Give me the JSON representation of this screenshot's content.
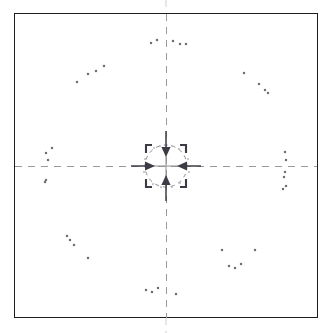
{
  "figure": {
    "title": "",
    "background_color": "#ffffff",
    "frame_color": "#1d1d1d",
    "axis_color": "#9a9a9a",
    "point_color": "#6f6f7a",
    "arrow_color": "#3c3c46",
    "width": 332,
    "height": 333
  },
  "chart_data": {
    "type": "scatter",
    "title": "",
    "subtitle": "",
    "xlabel": "",
    "ylabel": "",
    "xlim": [
      -166,
      166
    ],
    "ylim": [
      -166,
      166
    ],
    "grid": false,
    "legend": null,
    "center": {
      "x": 166,
      "y": 166
    },
    "annotations": {
      "center_circle_radius": 21,
      "crosshair_tick_length": 9,
      "axes": [
        {
          "name": "vertical-axis",
          "x1": 166,
          "y1": 2,
          "x2": 166,
          "y2": 331
        },
        {
          "name": "horizontal-axis",
          "x1": 2,
          "y1": 166,
          "x2": 330,
          "y2": 166
        }
      ],
      "inward_arrows": [
        {
          "name": "arrow-from-top",
          "dir": "down",
          "x": 166,
          "y1": 139,
          "y2": 158
        },
        {
          "name": "arrow-from-bottom",
          "dir": "up",
          "x": 166,
          "y1": 195,
          "y2": 176
        },
        {
          "name": "arrow-from-left",
          "dir": "right",
          "y": 166,
          "x1": 137,
          "x2": 155
        },
        {
          "name": "arrow-from-right",
          "dir": "left",
          "y": 166,
          "x1": 197,
          "x2": 178
        }
      ],
      "hook_glyphs": [
        {
          "name": "hook-top-left",
          "x": 148,
          "y": 150,
          "rotation": 0
        },
        {
          "name": "hook-top-right",
          "x": 184,
          "y": 150,
          "rotation": 90
        },
        {
          "name": "hook-bottom-left",
          "x": 148,
          "y": 182,
          "rotation": 270
        },
        {
          "name": "hook-bottom-right",
          "x": 184,
          "y": 182,
          "rotation": 180
        }
      ]
    },
    "series": [
      {
        "name": "quadrant-upper-left",
        "color": "#6f6f7a",
        "points": [
          {
            "x": 88,
            "y": 74
          },
          {
            "x": 96,
            "y": 71
          },
          {
            "x": 104,
            "y": 66
          },
          {
            "x": 77,
            "y": 82
          },
          {
            "x": 46,
            "y": 153
          },
          {
            "x": 48,
            "y": 160
          },
          {
            "x": 52,
            "y": 148
          },
          {
            "x": 45,
            "y": 182
          },
          {
            "x": 151,
            "y": 43
          },
          {
            "x": 157,
            "y": 40
          }
        ]
      },
      {
        "name": "quadrant-upper-right",
        "color": "#6f6f7a",
        "points": [
          {
            "x": 173,
            "y": 41
          },
          {
            "x": 180,
            "y": 44
          },
          {
            "x": 186,
            "y": 44
          },
          {
            "x": 244,
            "y": 73
          },
          {
            "x": 259,
            "y": 84
          },
          {
            "x": 265,
            "y": 90
          },
          {
            "x": 268,
            "y": 93
          },
          {
            "x": 285,
            "y": 152
          },
          {
            "x": 286,
            "y": 160
          },
          {
            "x": 285,
            "y": 172
          }
        ]
      },
      {
        "name": "quadrant-lower-left",
        "color": "#6f6f7a",
        "points": [
          {
            "x": 46,
            "y": 180
          },
          {
            "x": 67,
            "y": 236
          },
          {
            "x": 70,
            "y": 240
          },
          {
            "x": 74,
            "y": 245
          },
          {
            "x": 88,
            "y": 258
          },
          {
            "x": 146,
            "y": 290
          },
          {
            "x": 152,
            "y": 292
          },
          {
            "x": 158,
            "y": 288
          }
        ]
      },
      {
        "name": "quadrant-lower-right",
        "color": "#6f6f7a",
        "points": [
          {
            "x": 176,
            "y": 294
          },
          {
            "x": 222,
            "y": 250
          },
          {
            "x": 229,
            "y": 266
          },
          {
            "x": 235,
            "y": 268
          },
          {
            "x": 241,
            "y": 264
          },
          {
            "x": 255,
            "y": 250
          },
          {
            "x": 284,
            "y": 177
          },
          {
            "x": 286,
            "y": 186
          },
          {
            "x": 283,
            "y": 189
          }
        ]
      },
      {
        "name": "inner-ring-points",
        "color": "#b4b4bc",
        "points": [
          {
            "x": 154,
            "y": 148
          },
          {
            "x": 160,
            "y": 146
          },
          {
            "x": 172,
            "y": 146
          },
          {
            "x": 179,
            "y": 149
          },
          {
            "x": 145,
            "y": 159
          },
          {
            "x": 144,
            "y": 172
          },
          {
            "x": 188,
            "y": 159
          },
          {
            "x": 189,
            "y": 172
          },
          {
            "x": 153,
            "y": 184
          },
          {
            "x": 161,
            "y": 187
          },
          {
            "x": 172,
            "y": 187
          },
          {
            "x": 180,
            "y": 183
          }
        ]
      }
    ]
  }
}
